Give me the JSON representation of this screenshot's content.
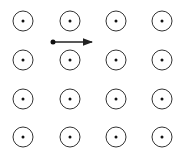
{
  "diagram": {
    "background": "#ffffff",
    "stroke_color": "#333333",
    "field": {
      "direction": "out-of-page",
      "symbol": "dot-in-circle",
      "columns_x": [
        23,
        70,
        116,
        162
      ],
      "rows_y": [
        21,
        60,
        99,
        137
      ],
      "radius": 10
    },
    "particle": {
      "x": 53,
      "y": 42,
      "velocity_direction": "right",
      "arrow_end_x": 94
    }
  }
}
